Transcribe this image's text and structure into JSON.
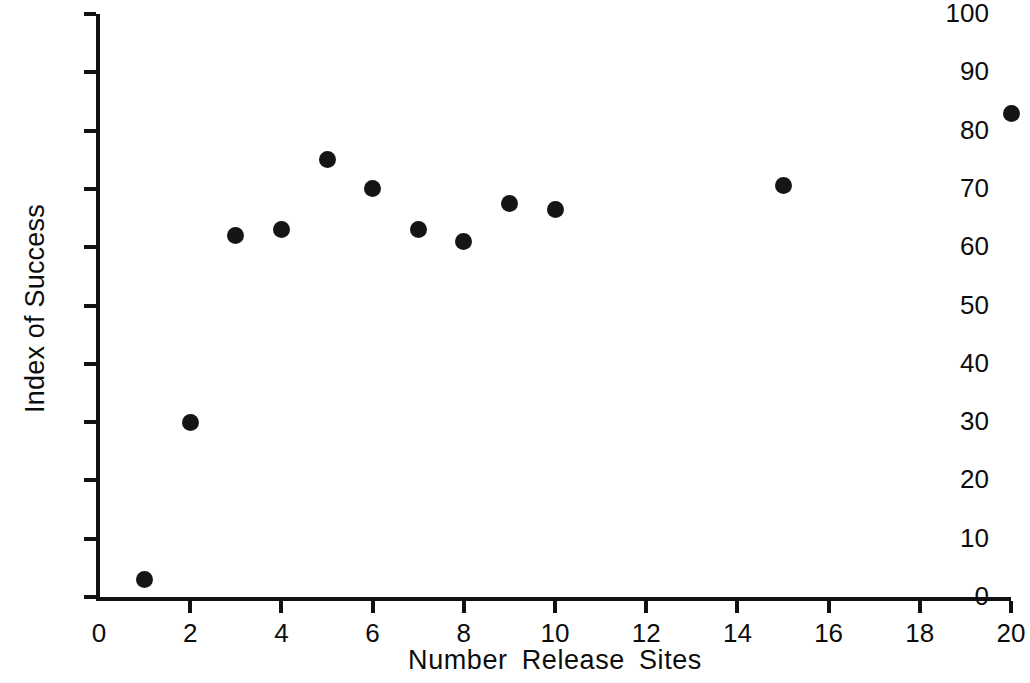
{
  "chart_data": {
    "type": "scatter",
    "title": "",
    "xlabel": "Number  Release  Sites",
    "ylabel": "Index of Success",
    "xlabel_words": [
      "Number",
      "Release",
      "Sites"
    ],
    "xlim": [
      0,
      20
    ],
    "ylim": [
      0,
      100
    ],
    "xticks": [
      0,
      2,
      4,
      6,
      8,
      10,
      12,
      14,
      16,
      18,
      20
    ],
    "xticklabels": [
      "0",
      "2",
      "4",
      "6",
      "8",
      "10",
      "12",
      "14",
      "16",
      "18",
      "20"
    ],
    "yticks": [
      0,
      10,
      20,
      30,
      40,
      50,
      60,
      70,
      80,
      90,
      100
    ],
    "yticklabels": [
      "0",
      "10",
      "20",
      "30",
      "40",
      "50",
      "60",
      "70",
      "80",
      "90",
      "100"
    ],
    "grid": false,
    "legend": null,
    "marker": "filled-circle",
    "marker_color": "#151515",
    "axis_color": "#111111",
    "background": "#ffffff",
    "x": [
      1,
      2,
      3,
      4,
      5,
      6,
      7,
      8,
      9,
      10,
      15,
      20
    ],
    "y": [
      3,
      30,
      62,
      63,
      75,
      70,
      63,
      61,
      67.5,
      66.5,
      70.5,
      83
    ],
    "points": [
      {
        "x": 1,
        "y": 3
      },
      {
        "x": 2,
        "y": 30
      },
      {
        "x": 3,
        "y": 62
      },
      {
        "x": 4,
        "y": 63
      },
      {
        "x": 5,
        "y": 75
      },
      {
        "x": 6,
        "y": 70
      },
      {
        "x": 7,
        "y": 63
      },
      {
        "x": 8,
        "y": 61
      },
      {
        "x": 9,
        "y": 67.5
      },
      {
        "x": 10,
        "y": 66.5
      },
      {
        "x": 15,
        "y": 70.5
      },
      {
        "x": 20,
        "y": 83
      }
    ]
  }
}
